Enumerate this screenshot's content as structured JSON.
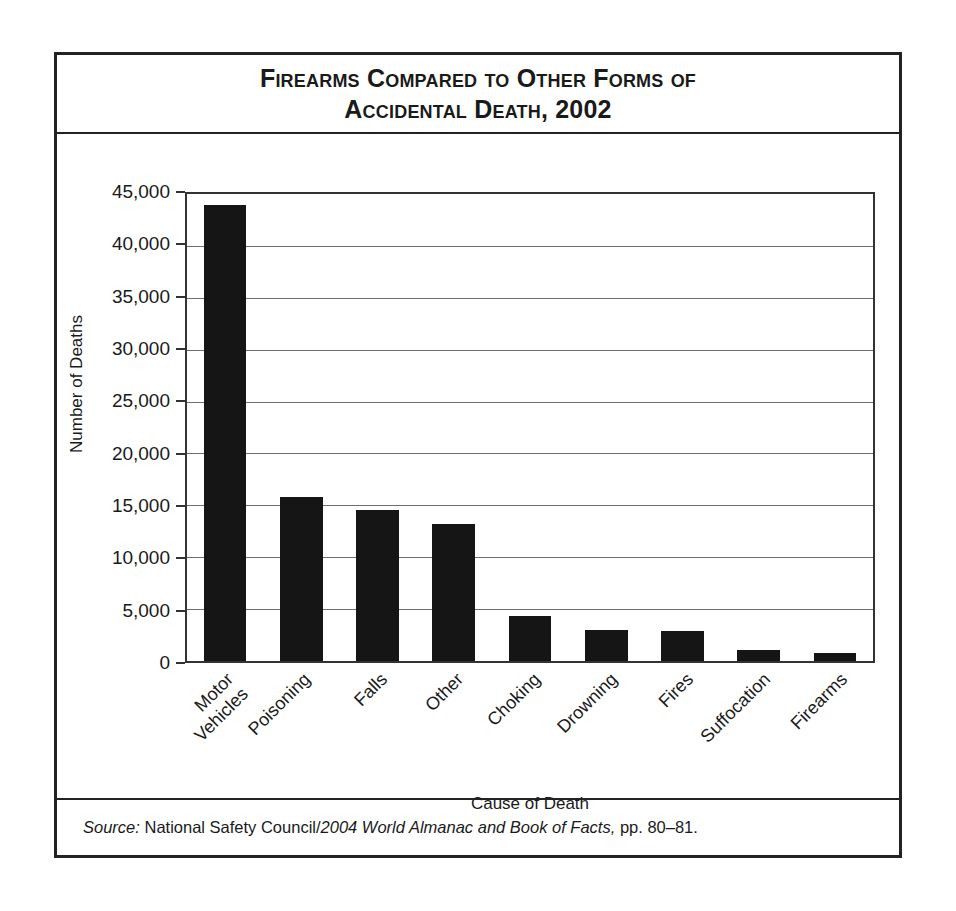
{
  "figure": {
    "title_line1": "Firearms Compared to Other Forms of",
    "title_line2": "Accidental Death, 2002",
    "source": {
      "label": "Source:",
      "publisher": "National Safety Council/",
      "work": "2004 World Almanac and Book of Facts,",
      "pages": "pp. 80–81."
    }
  },
  "chart_data": {
    "type": "bar",
    "title": "Firearms Compared to Other Forms of Accidental Death, 2002",
    "xlabel": "Cause of Death",
    "ylabel": "Number of Deaths",
    "ylim": [
      0,
      45000
    ],
    "ytick_step": 5000,
    "grid": true,
    "legend": "none",
    "bar_color": "#151515",
    "ytick_labels": [
      "0",
      "5,000",
      "10,000",
      "15,000",
      "20,000",
      "25,000",
      "30,000",
      "35,000",
      "40,000",
      "45,000"
    ],
    "yticks": [
      0,
      5000,
      10000,
      15000,
      20000,
      25000,
      30000,
      35000,
      40000,
      45000
    ],
    "categories": [
      "Motor Vehicles",
      "Poisoning",
      "Falls",
      "Other",
      "Choking",
      "Drowning",
      "Fires",
      "Suffocation",
      "Firearms"
    ],
    "category_lines": [
      [
        "Motor",
        "Vehicles"
      ],
      [
        "Poisoning"
      ],
      [
        "Falls"
      ],
      [
        "Other"
      ],
      [
        "Choking"
      ],
      [
        "Drowning"
      ],
      [
        "Fires"
      ],
      [
        "Suffocation"
      ],
      [
        "Firearms"
      ]
    ],
    "values": [
      43900,
      15800,
      14600,
      13200,
      4300,
      3000,
      2900,
      1100,
      800
    ]
  }
}
